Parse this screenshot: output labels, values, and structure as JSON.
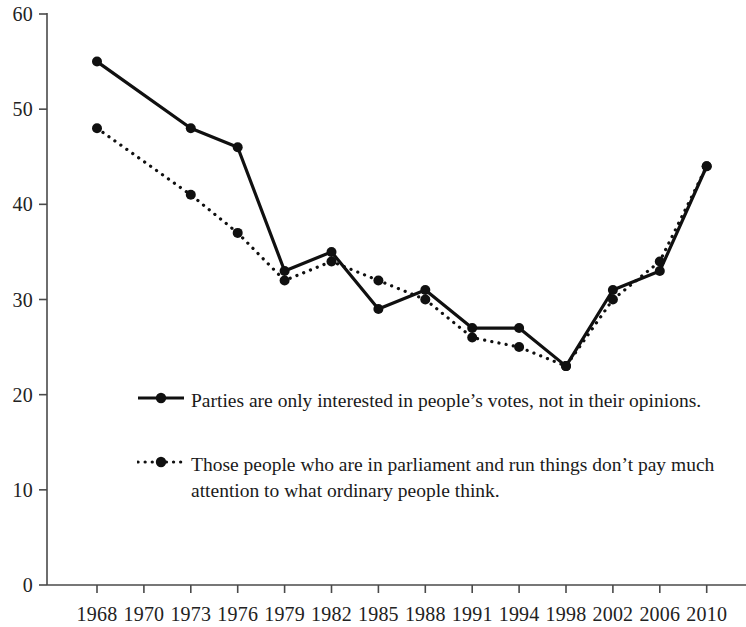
{
  "chart_data": {
    "type": "line",
    "title": "",
    "subtitle": "",
    "xlabel": "",
    "ylabel": "",
    "categories": [
      "1968",
      "1970",
      "1973",
      "1976",
      "1979",
      "1982",
      "1985",
      "1988",
      "1991",
      "1994",
      "1998",
      "2002",
      "2006",
      "2010"
    ],
    "xtick_labels": [
      "1968",
      "1970",
      "1973",
      "1976",
      "1979",
      "1982",
      "1985",
      "1988",
      "1991",
      "1994",
      "1998",
      "2002",
      "2006",
      "2010"
    ],
    "ytick_labels": [
      "0",
      "10",
      "20",
      "30",
      "40",
      "50",
      "60"
    ],
    "yticks": [
      0,
      10,
      20,
      30,
      40,
      50,
      60
    ],
    "ylim": [
      0,
      60
    ],
    "grid": false,
    "legend_position": "inside-center",
    "series": [
      {
        "name": "Parties are only interested in people’s votes, not in their opinions.",
        "style": "solid",
        "marker": "filled-circle",
        "color": "#101010",
        "values": [
          55,
          null,
          48,
          46,
          33,
          35,
          29,
          31,
          27,
          27,
          23,
          31,
          33,
          44
        ]
      },
      {
        "name": "Those people who are in parliament and run things don’t pay much attention to what ordinary people think.",
        "style": "dotted",
        "marker": "filled-circle",
        "color": "#101010",
        "values": [
          48,
          null,
          41,
          37,
          32,
          34,
          32,
          30,
          26,
          25,
          23,
          30,
          34,
          44
        ]
      }
    ]
  },
  "legend": {
    "entries": [
      {
        "label": "Parties are only interested in people’s votes, not in their opinions.",
        "style": "solid"
      },
      {
        "label": "Those people who are in parliament and run things don’t pay much attention to what ordinary people think.",
        "style": "dotted"
      }
    ]
  },
  "axis": {
    "line_color": "#4a4a4a"
  }
}
